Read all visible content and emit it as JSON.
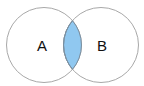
{
  "diagram": {
    "type": "venn",
    "sets": [
      {
        "id": "A",
        "label": "A"
      },
      {
        "id": "B",
        "label": "B"
      }
    ],
    "highlighted_region": "A ∩ B",
    "colors": {
      "outline": "#a8a8a8",
      "highlight_fill": "#90c8f0",
      "highlight_stroke": "#7a8fa0",
      "label": "#111111"
    }
  }
}
